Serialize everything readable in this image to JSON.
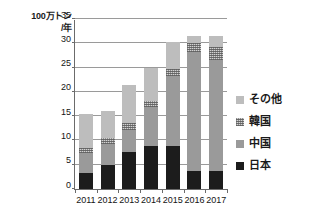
{
  "chart_data": {
    "type": "bar",
    "stacked": true,
    "title": "",
    "subtitle": "",
    "xlabel": "",
    "ylabel": "100万トン/年",
    "ylabel_lines": [
      "100万トン",
      "/年"
    ],
    "categories": [
      "2011",
      "2012",
      "2013",
      "2014",
      "2015",
      "2016",
      "2017"
    ],
    "series": [
      {
        "name": "日本",
        "color": "#1c1c1c",
        "values": [
          3.4,
          5.0,
          7.7,
          8.8,
          8.8,
          3.7,
          3.7
        ]
      },
      {
        "name": "中国",
        "color": "#9a9a9a",
        "values": [
          4.0,
          4.3,
          4.5,
          8.0,
          14.4,
          24.5,
          22.8
        ]
      },
      {
        "name": "韓国",
        "color": "#d2d2d2",
        "values": [
          1.0,
          1.2,
          1.3,
          1.3,
          1.6,
          1.9,
          2.8
        ]
      },
      {
        "name": "その他",
        "color": "#bdbdbd",
        "values": [
          7.0,
          5.5,
          8.0,
          6.9,
          5.5,
          1.5,
          2.3
        ]
      }
    ],
    "totals": [
      15.4,
      16.0,
      21.5,
      25.0,
      30.3,
      31.6,
      31.6
    ],
    "ylim": [
      0,
      35
    ],
    "ytick_step": 5,
    "yticks": [
      0,
      5,
      10,
      15,
      20,
      25,
      30,
      35
    ],
    "grid": true,
    "legend_position": "right",
    "legend_order": [
      "その他",
      "韓国",
      "中国",
      "日本"
    ]
  }
}
